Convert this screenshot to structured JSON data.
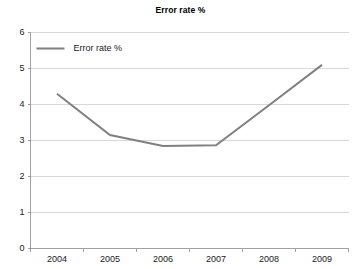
{
  "chart_data": {
    "type": "line",
    "title": "Error rate %",
    "xlabel": "",
    "ylabel": "",
    "categories": [
      "2004",
      "2005",
      "2006",
      "2007",
      "2008",
      "2009"
    ],
    "series": [
      {
        "name": "Error rate %",
        "values": [
          4.3,
          3.15,
          2.85,
          2.87,
          3.98,
          5.1
        ],
        "color": "#808080"
      }
    ],
    "ylim": [
      0,
      6
    ],
    "ytick_labels": [
      "0",
      "1",
      "2",
      "3",
      "4",
      "5",
      "6"
    ],
    "ytick_values": [
      0,
      1,
      2,
      3,
      4,
      5,
      6
    ],
    "grid": true,
    "grid_axis": "y",
    "grid_color": "#c8c8c8",
    "legend": {
      "position": "top-left-inside",
      "entries": [
        {
          "label": "Error rate %",
          "color": "#808080"
        }
      ]
    },
    "axis_color": "#8a8a8a",
    "background": "#ffffff"
  }
}
